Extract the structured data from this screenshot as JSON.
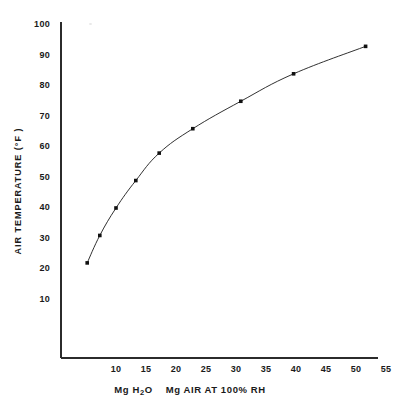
{
  "chart_data": {
    "type": "line",
    "title": "",
    "subtitle": "",
    "xlabel": "Mg H2O   Mg AIR AT  100% RH",
    "xlabel_parts": {
      "prefix": "Mg  H",
      "subscript": "2",
      "middle": "O",
      "suffix": "Mg  AIR AT  100% RH"
    },
    "ylabel": "AIR TEMPERATURE  (°F )",
    "x": [
      5.2,
      7.3,
      10.0,
      13.3,
      17.2,
      22.8,
      30.8,
      39.6,
      51.6
    ],
    "values": [
      22,
      31,
      40,
      49,
      58,
      66,
      75,
      84,
      93
    ],
    "series": [
      {
        "name": "Air temperature vs absolute humidity at 100% RH",
        "x": [
          5.2,
          7.3,
          10.0,
          13.3,
          17.2,
          22.8,
          30.8,
          39.6,
          51.6
        ],
        "values": [
          22,
          31,
          40,
          49,
          58,
          66,
          75,
          84,
          93
        ]
      }
    ],
    "xlim": [
      0,
      55
    ],
    "ylim": [
      0,
      100
    ],
    "xticks": [
      10,
      15,
      20,
      25,
      30,
      35,
      40,
      45,
      50,
      55
    ],
    "yticks": [
      10,
      20,
      30,
      40,
      50,
      60,
      70,
      80,
      90,
      100
    ],
    "xtick_labels": [
      "10",
      "15",
      "20",
      "25",
      "30",
      "35",
      "40",
      "45",
      "50",
      "55"
    ],
    "ytick_labels": [
      "10",
      "20",
      "30",
      "40",
      "50",
      "60",
      "70",
      "80",
      "90",
      "100"
    ],
    "grid": false,
    "legend": null,
    "legend_position": "none",
    "marker": "square",
    "line_color": "#1a1a1a",
    "marker_color": "#111111",
    "axis_color": "#2b2b2b",
    "background_color": "#ffffff",
    "annotations": []
  },
  "axis_titles": {
    "y": "AIR TEMPERATURE  (°F )",
    "x_prefix": "Mg  H",
    "x_subscript": "2",
    "x_middle": "O",
    "x_suffix": "Mg  AIR AT  100% RH"
  }
}
